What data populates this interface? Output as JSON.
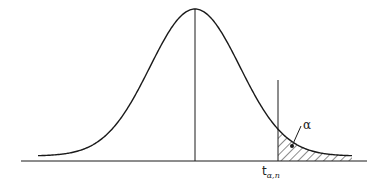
{
  "chart_data": {
    "type": "area",
    "title": "",
    "xlabel": "",
    "ylabel": "",
    "grid": false,
    "legend": "none",
    "curve": {
      "kind": "gaussian",
      "center_px": 195,
      "sigma_px": 45,
      "peak_y_px": 9,
      "baseline_y_px": 156,
      "x_start_px": 38,
      "x_end_px": 352
    },
    "axis": {
      "y_px": 161,
      "x_start_px": 21,
      "x_end_px": 367
    },
    "center_line": {
      "x_px": 195
    },
    "critical_line": {
      "x_px": 278,
      "y_top_px": 80
    },
    "shaded_region": {
      "from": "critical_value",
      "to": "right_tail",
      "pattern": "diagonal-hatch"
    },
    "annotations": [
      {
        "text": "α",
        "meaning": "right-tail probability",
        "x_px": 302,
        "y_px": 131
      },
      {
        "text": "t",
        "subscript": "α,n",
        "meaning": "critical value",
        "x_px": 262,
        "y_px": 178
      }
    ]
  },
  "labels": {
    "alpha": "α",
    "critical_main": "t",
    "critical_sub": "α,n"
  },
  "colors": {
    "stroke": "#1a1a1a",
    "background": "#ffffff"
  }
}
